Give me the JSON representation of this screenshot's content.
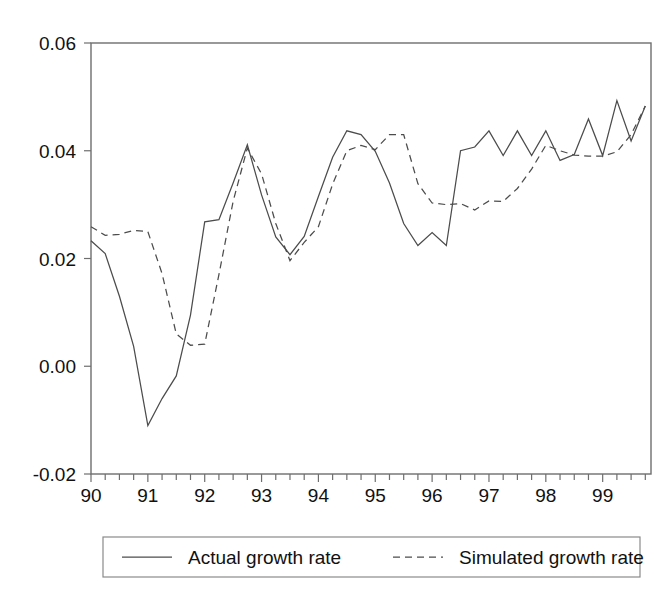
{
  "chart_data": {
    "type": "line",
    "title": "",
    "xlabel": "",
    "ylabel": "",
    "grid": false,
    "legend_position": "bottom",
    "xlim": [
      1990.0,
      1999.85
    ],
    "ylim": [
      -0.02,
      0.06
    ],
    "ytick_labels": [
      "0.06",
      "0.04",
      "0.02",
      "0.00",
      "-0.02"
    ],
    "ytick_values": [
      0.06,
      0.04,
      0.02,
      0.0,
      -0.02
    ],
    "xtick_labels": [
      "90",
      "91",
      "92",
      "93",
      "94",
      "95",
      "96",
      "97",
      "98",
      "99"
    ],
    "xtick_values": [
      1990,
      1991,
      1992,
      1993,
      1994,
      1995,
      1996,
      1997,
      1998,
      1999
    ],
    "minor_ticks_per_year": 4,
    "x": [
      1990.0,
      1990.25,
      1990.5,
      1990.75,
      1991.0,
      1991.25,
      1991.5,
      1991.75,
      1992.0,
      1992.25,
      1992.5,
      1992.75,
      1993.0,
      1993.25,
      1993.5,
      1993.75,
      1994.0,
      1994.25,
      1994.5,
      1994.75,
      1995.0,
      1995.25,
      1995.5,
      1995.75,
      1996.0,
      1996.25,
      1996.5,
      1996.75,
      1997.0,
      1997.25,
      1997.5,
      1997.75,
      1998.0,
      1998.25,
      1998.5,
      1998.75,
      1999.0,
      1999.25,
      1999.5,
      1999.75
    ],
    "series": [
      {
        "name": "Actual growth rate",
        "style": "solid",
        "color": "#4c4c4c",
        "values": [
          0.0233,
          0.0209,
          0.013,
          0.0037,
          -0.011,
          -0.006,
          -0.0018,
          0.0095,
          0.0268,
          0.0272,
          0.034,
          0.0411,
          0.0318,
          0.024,
          0.0207,
          0.0241,
          0.0315,
          0.0388,
          0.0437,
          0.043,
          0.0399,
          0.034,
          0.0265,
          0.0224,
          0.0248,
          0.0224,
          0.04,
          0.0407,
          0.0437,
          0.0391,
          0.0437,
          0.0391,
          0.0437,
          0.0382,
          0.0393,
          0.0459,
          0.0391,
          0.0493,
          0.0418,
          0.0483
        ]
      },
      {
        "name": "Simulated growth rate",
        "style": "dashed",
        "color": "#4c4c4c",
        "values": [
          0.0259,
          0.0243,
          0.0245,
          0.0252,
          0.025,
          0.0172,
          0.006,
          0.0039,
          0.0041,
          0.017,
          0.0306,
          0.0405,
          0.0357,
          0.0265,
          0.0196,
          0.023,
          0.0259,
          0.0338,
          0.04,
          0.041,
          0.0402,
          0.043,
          0.043,
          0.0339,
          0.0303,
          0.03,
          0.0302,
          0.029,
          0.0307,
          0.0306,
          0.033,
          0.0366,
          0.041,
          0.04,
          0.0392,
          0.039,
          0.039,
          0.0398,
          0.043,
          0.0483
        ]
      }
    ]
  },
  "legend": {
    "entries": [
      {
        "label": "Actual growth rate",
        "style": "solid"
      },
      {
        "label": "Simulated growth rate",
        "style": "dashed"
      }
    ]
  }
}
